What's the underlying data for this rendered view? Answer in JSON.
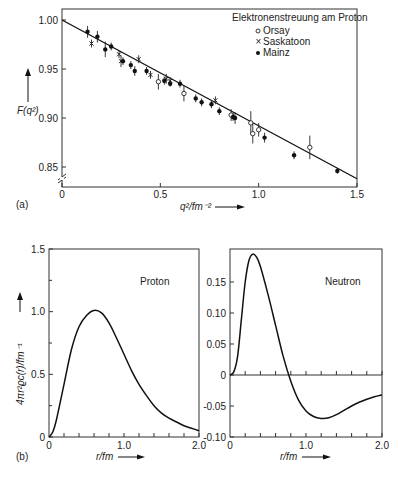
{
  "chart_data": [
    {
      "id": "a",
      "panel_label": "(a)",
      "type": "scatter",
      "title": "Elektronenstreuung am Proton",
      "xlabel": "q²/fm⁻²",
      "ylabel": "F(q²)",
      "xlim": [
        0,
        1.5
      ],
      "ylim": [
        0.835,
        1.005
      ],
      "xticks": [
        "0",
        "0.5",
        "1.0",
        "1.5"
      ],
      "yticks": [
        "0.85",
        "0.90",
        "0.95",
        "1.00"
      ],
      "axis_break": true,
      "legend_position": "upper right",
      "grid": false,
      "fit_line": {
        "x": [
          0,
          1.5
        ],
        "y": [
          1.0,
          0.838
        ]
      },
      "series": [
        {
          "name": "Orsay",
          "marker": "open-circle",
          "points": [
            [
              0.49,
              0.937
            ],
            [
              0.62,
              0.925
            ],
            [
              0.86,
              0.903
            ],
            [
              0.96,
              0.895
            ],
            [
              0.97,
              0.884
            ],
            [
              1.0,
              0.888
            ],
            [
              1.26,
              0.87
            ]
          ],
          "err": [
            0.008,
            0.008,
            0.006,
            0.012,
            0.01,
            0.007,
            0.012
          ]
        },
        {
          "name": "Saskatoon",
          "marker": "cross",
          "points": [
            [
              0.15,
              0.976
            ],
            [
              0.29,
              0.965
            ],
            [
              0.3,
              0.958
            ],
            [
              0.39,
              0.96
            ],
            [
              0.45,
              0.944
            ],
            [
              0.53,
              0.94
            ],
            [
              0.55,
              0.938
            ],
            [
              0.78,
              0.918
            ]
          ],
          "err": [
            0.004,
            0.004,
            0.006,
            0.004,
            0.004,
            0.005,
            0.004,
            0.004
          ]
        },
        {
          "name": "Mainz",
          "marker": "filled-circle",
          "points": [
            [
              0.13,
              0.988
            ],
            [
              0.18,
              0.983
            ],
            [
              0.22,
              0.97
            ],
            [
              0.25,
              0.973
            ],
            [
              0.31,
              0.958
            ],
            [
              0.35,
              0.954
            ],
            [
              0.37,
              0.948
            ],
            [
              0.43,
              0.948
            ],
            [
              0.52,
              0.938
            ],
            [
              0.55,
              0.935
            ],
            [
              0.6,
              0.935
            ],
            [
              0.68,
              0.92
            ],
            [
              0.71,
              0.916
            ],
            [
              0.76,
              0.914
            ],
            [
              0.8,
              0.907
            ],
            [
              0.87,
              0.901
            ],
            [
              0.88,
              0.9
            ],
            [
              1.03,
              0.88
            ],
            [
              1.18,
              0.862
            ],
            [
              1.4,
              0.846
            ]
          ],
          "err": [
            0.006,
            0.006,
            0.008,
            0.004,
            0.004,
            0.004,
            0.005,
            0.004,
            0.004,
            0.003,
            0.004,
            0.004,
            0.004,
            0.004,
            0.004,
            0.004,
            0.006,
            0.005,
            0.004,
            0.003
          ]
        }
      ]
    },
    {
      "id": "b1",
      "panel_label": "(b)",
      "type": "line",
      "title": "Proton",
      "xlabel": "r/fm",
      "ylabel": "4πr²ϱc(r)/fm⁻¹",
      "xlim": [
        0,
        2.0
      ],
      "ylim": [
        0,
        1.5
      ],
      "xticks": [
        "0",
        "1.0",
        "2.0"
      ],
      "yticks": [
        "0",
        "0.5",
        "1.0",
        "1.5"
      ],
      "grid": false,
      "x": [
        0,
        0.05,
        0.1,
        0.2,
        0.3,
        0.4,
        0.5,
        0.6,
        0.7,
        0.8,
        0.9,
        1.0,
        1.1,
        1.2,
        1.3,
        1.4,
        1.5,
        1.6,
        1.7,
        1.8,
        1.9,
        2.0
      ],
      "y": [
        0,
        0.04,
        0.14,
        0.42,
        0.7,
        0.88,
        0.97,
        1.01,
        0.99,
        0.91,
        0.79,
        0.66,
        0.53,
        0.42,
        0.33,
        0.25,
        0.19,
        0.15,
        0.12,
        0.09,
        0.07,
        0.05
      ]
    },
    {
      "id": "b2",
      "type": "line",
      "title": "Neutron",
      "xlabel": "r/fm",
      "ylabel": "",
      "xlim": [
        0,
        2.0
      ],
      "ylim": [
        -0.1,
        0.2
      ],
      "xticks": [
        "0",
        "1.0",
        "2.0"
      ],
      "yticks": [
        "-0.10",
        "-0.05",
        "0",
        "0.05",
        "0.10",
        "0.15"
      ],
      "zero_line": true,
      "grid": false,
      "x": [
        0,
        0.05,
        0.1,
        0.15,
        0.2,
        0.25,
        0.3,
        0.35,
        0.4,
        0.5,
        0.6,
        0.7,
        0.8,
        0.9,
        1.0,
        1.1,
        1.2,
        1.3,
        1.4,
        1.5,
        1.6,
        1.7,
        1.8,
        1.9,
        2.0
      ],
      "y": [
        0,
        0.005,
        0.03,
        0.09,
        0.15,
        0.185,
        0.195,
        0.19,
        0.175,
        0.13,
        0.08,
        0.03,
        -0.01,
        -0.04,
        -0.058,
        -0.067,
        -0.07,
        -0.069,
        -0.064,
        -0.057,
        -0.05,
        -0.044,
        -0.039,
        -0.035,
        -0.032
      ]
    }
  ]
}
